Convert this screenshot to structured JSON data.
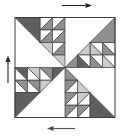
{
  "figure": {
    "description_name": "quilt-block-rotation-diagram",
    "canvas": {
      "width": 131,
      "height": 136,
      "background": "#ffffff"
    },
    "block": {
      "x": 15,
      "y": 17.5,
      "size": 100,
      "border_color": "#3d3d3d",
      "border_width": 1
    },
    "cell": 12.5,
    "corner_size": 25,
    "outline_color": "#3d3d3d",
    "outline_width": 0.7,
    "colors": {
      "dark": "#5f5f5f",
      "medium": "#8f8f8f",
      "light": "#cbcbcb",
      "white": "#ffffff"
    },
    "quadrants": [
      {
        "name": "top-left",
        "rotation": 0,
        "corner_fill": "dark",
        "cells": [
          {
            "r": 0,
            "c": 2,
            "fill": "medium"
          },
          {
            "r": 0,
            "c": 3,
            "fill": "medium"
          },
          {
            "r": 1,
            "c": 2,
            "fill": "medium"
          },
          {
            "r": 1,
            "c": 3,
            "fill": "medium"
          },
          {
            "r": 2,
            "c": 2,
            "fill": "light"
          },
          {
            "r": 2,
            "c": 3,
            "fill": "medium"
          },
          {
            "r": 3,
            "c": 3,
            "fill": "light"
          }
        ]
      },
      {
        "name": "top-right",
        "rotation": 90,
        "corner_fill": "medium",
        "cells": [
          {
            "r": 0,
            "c": 2,
            "fill": "medium"
          },
          {
            "r": 0,
            "c": 3,
            "fill": "light"
          },
          {
            "r": 1,
            "c": 2,
            "fill": "light"
          },
          {
            "r": 1,
            "c": 3,
            "fill": "medium"
          },
          {
            "r": 2,
            "c": 2,
            "fill": "light"
          },
          {
            "r": 2,
            "c": 3,
            "fill": "dark"
          },
          {
            "r": 3,
            "c": 3,
            "fill": "medium"
          }
        ]
      },
      {
        "name": "bottom-right",
        "rotation": 180,
        "corner_fill": "dark",
        "cells": [
          {
            "r": 0,
            "c": 2,
            "fill": "medium"
          },
          {
            "r": 0,
            "c": 3,
            "fill": "medium"
          },
          {
            "r": 1,
            "c": 2,
            "fill": "light"
          },
          {
            "r": 1,
            "c": 3,
            "fill": "medium"
          },
          {
            "r": 2,
            "c": 2,
            "fill": "light"
          },
          {
            "r": 2,
            "c": 3,
            "fill": "medium"
          },
          {
            "r": 3,
            "c": 3,
            "fill": "medium"
          }
        ]
      },
      {
        "name": "bottom-left",
        "rotation": 270,
        "corner_fill": "dark",
        "cells": [
          {
            "r": 0,
            "c": 2,
            "fill": "medium"
          },
          {
            "r": 0,
            "c": 3,
            "fill": "dark"
          },
          {
            "r": 1,
            "c": 2,
            "fill": "medium"
          },
          {
            "r": 1,
            "c": 3,
            "fill": "light"
          },
          {
            "r": 2,
            "c": 2,
            "fill": "light"
          },
          {
            "r": 2,
            "c": 3,
            "fill": "medium"
          },
          {
            "r": 3,
            "c": 3,
            "fill": "dark"
          }
        ]
      }
    ],
    "arrows": [
      {
        "name": "top-rotation-arrow",
        "direction": "right",
        "from": [
          62,
          5.5
        ],
        "to": [
          92,
          5.5
        ],
        "color": "#262626"
      },
      {
        "name": "left-rotation-arrow",
        "direction": "up",
        "from": [
          8,
          83
        ],
        "to": [
          8,
          55.5
        ],
        "color": "#262626"
      },
      {
        "name": "bottom-rotation-arrow",
        "direction": "left",
        "from": [
          75,
          128.5
        ],
        "to": [
          47,
          128.5
        ],
        "color": "#4f4f4f"
      }
    ]
  }
}
